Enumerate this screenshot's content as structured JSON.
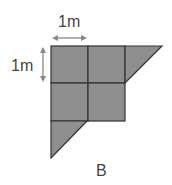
{
  "diagram": {
    "horizontal_dimension_label": "1m",
    "vertical_dimension_label": "1m",
    "caption": "B",
    "fill_color": "#8f8f8f",
    "stroke_color": "#333333",
    "arrow_color": "#888888",
    "shape": {
      "description": "Shape composed of 4 unit squares (2x2) plus two right triangles: one attached to right of top row, one attached below left column",
      "unit_squares": 4,
      "triangles": 2
    }
  }
}
